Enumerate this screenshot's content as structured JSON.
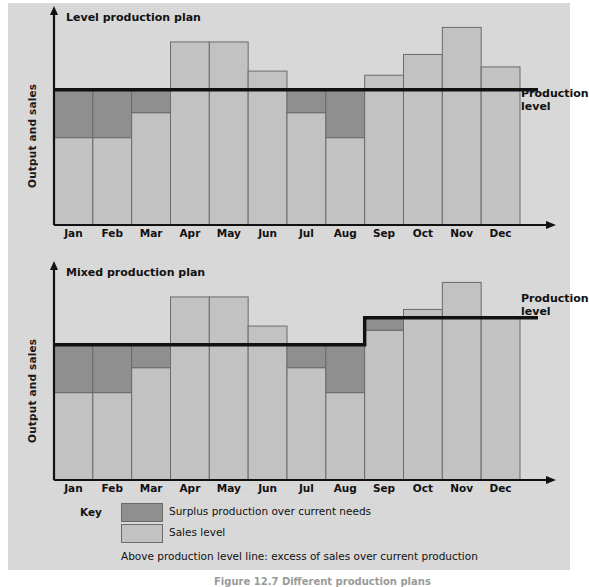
{
  "figure": {
    "caption": "Figure 12.7 Different production plans",
    "background_color": "#d9d9d9",
    "page_color": "#ffffff"
  },
  "colors": {
    "surplus": "#8f8f8f",
    "sales": "#c2c2c2",
    "bar_outline": "#6b6b6b",
    "axis": "#111111",
    "text": "#111111"
  },
  "charts": [
    {
      "id": "level-production-plan",
      "title": "Level production plan",
      "ylabel": "Output and sales",
      "production_label": "Production level"
    },
    {
      "id": "mixed-production-plan",
      "title": "Mixed production plan",
      "ylabel": "Output and sales",
      "production_label": "Production level"
    }
  ],
  "key": {
    "label": "Key",
    "items": [
      {
        "swatch": "surplus",
        "text": "Surplus production over current needs"
      },
      {
        "swatch": "sales",
        "text": "Sales level"
      }
    ],
    "note": "Above production level line: excess of sales over current production"
  },
  "chart_data": [
    {
      "type": "bar",
      "id": "level-production-plan",
      "title": "Level production plan",
      "xlabel": "",
      "ylabel": "Output and sales",
      "grid": false,
      "legend": "below",
      "categories": [
        "Jan",
        "Feb",
        "Mar",
        "Apr",
        "May",
        "Jun",
        "Jul",
        "Aug",
        "Sep",
        "Oct",
        "Nov",
        "Dec"
      ],
      "ylim": [
        0,
        100
      ],
      "production_level": 65,
      "production_level_label": "Production level",
      "production_level_stepped": false,
      "series": [
        {
          "name": "Sales level",
          "values": [
            42,
            42,
            54,
            88,
            88,
            74,
            54,
            42,
            72,
            82,
            95,
            76
          ]
        },
        {
          "name": "Surplus production over current needs",
          "values": [
            23,
            23,
            11,
            0,
            0,
            0,
            11,
            23,
            0,
            0,
            0,
            0
          ]
        }
      ],
      "notes": "Bars reaching above the production level line show excess of sales over current production (Apr, May, Jun, Sep, Oct, Nov, Dec). Dark bands below the line (Jan, Feb, Mar, Jul, Aug) show surplus production over current needs."
    },
    {
      "type": "bar",
      "id": "mixed-production-plan",
      "title": "Mixed production plan",
      "xlabel": "",
      "ylabel": "Output and sales",
      "grid": false,
      "legend": "below",
      "categories": [
        "Jan",
        "Feb",
        "Mar",
        "Apr",
        "May",
        "Jun",
        "Jul",
        "Aug",
        "Sep",
        "Oct",
        "Nov",
        "Dec"
      ],
      "ylim": [
        0,
        100
      ],
      "production_level_label": "Production level",
      "production_level_stepped": true,
      "production_level_steps": [
        {
          "from": "Jan",
          "to": "Aug",
          "value": 65
        },
        {
          "from": "Sep",
          "to": "Dec",
          "value": 78
        }
      ],
      "series": [
        {
          "name": "Sales level",
          "values": [
            42,
            42,
            54,
            88,
            88,
            74,
            54,
            42,
            72,
            82,
            95,
            78
          ]
        },
        {
          "name": "Surplus production over current needs",
          "values": [
            23,
            23,
            11,
            0,
            0,
            0,
            11,
            23,
            6,
            0,
            0,
            0
          ]
        }
      ],
      "notes": "The production level line steps up between Aug and Sep. Sep carries a surplus band up to the higher production level; Oct and Nov rise above it; Dec meets it exactly."
    }
  ]
}
